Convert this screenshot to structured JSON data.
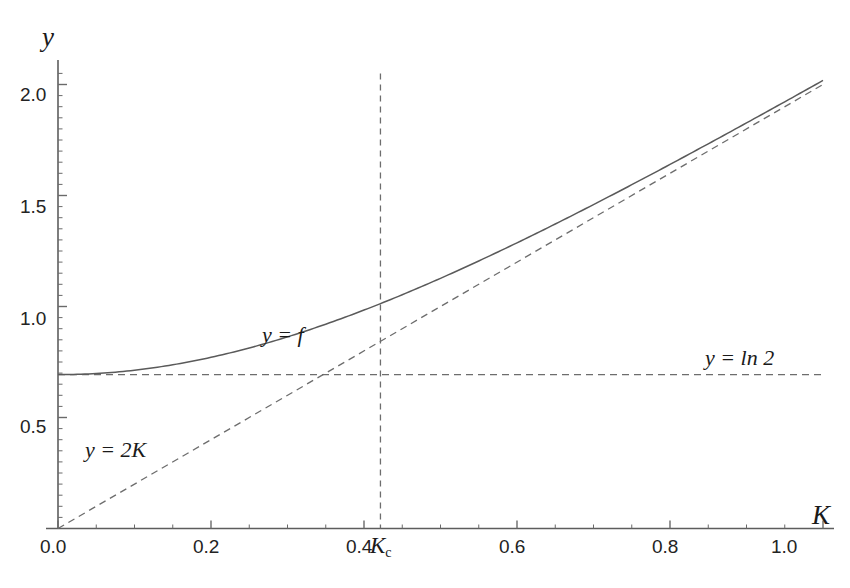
{
  "chart_data": {
    "type": "line",
    "title": "",
    "xlabel": "K",
    "ylabel": "y",
    "xlim": [
      0.0,
      1.0
    ],
    "ylim": [
      0.0,
      2.05
    ],
    "grid": false,
    "legend_position": "inline-annotations",
    "x_ticks": [
      "0.0",
      "0.2",
      "0.4",
      "0.6",
      "0.8",
      "1.0"
    ],
    "x_tick_values": [
      0.0,
      0.2,
      0.4,
      0.6,
      0.8,
      1.0
    ],
    "x_minor_tick_step": 0.05,
    "y_ticks": [
      "0.5",
      "1.0",
      "1.5",
      "2.0"
    ],
    "y_tick_values": [
      0.5,
      1.0,
      1.5,
      2.0
    ],
    "y_minor_tick_step": 0.05,
    "series": [
      {
        "name": "y = f",
        "style": "solid",
        "label": "y = f",
        "label_math": {
          "lhs": "y",
          "op": "=",
          "rhs": "f"
        },
        "x": [
          0.0,
          0.05,
          0.1,
          0.15,
          0.2,
          0.25,
          0.3,
          0.35,
          0.4,
          0.45,
          0.5,
          0.55,
          0.6,
          0.65,
          0.7,
          0.75,
          0.8,
          0.85,
          0.9,
          0.95,
          1.0
        ],
        "y": [
          0.693,
          0.696,
          0.705,
          0.721,
          0.744,
          0.773,
          0.809,
          0.851,
          0.898,
          0.95,
          1.006,
          1.065,
          1.127,
          1.192,
          1.259,
          1.327,
          1.397,
          1.468,
          1.54,
          1.613,
          1.687
        ]
      },
      {
        "name": "y = 2K",
        "style": "dashed",
        "label": "y = 2K",
        "label_math": {
          "lhs": "y",
          "op": "=",
          "rhs": "2K"
        },
        "x": [
          0.0,
          1.0
        ],
        "y": [
          0.0,
          2.0
        ]
      },
      {
        "name": "y = ln 2",
        "style": "dashed",
        "label": "y = ln 2",
        "label_math": {
          "lhs": "y",
          "op": "=",
          "rhs": "ln 2"
        },
        "x": [
          0.0,
          1.0
        ],
        "y": [
          0.693,
          0.693
        ]
      }
    ],
    "annotations": [
      {
        "name": "kc-marker",
        "label": "K",
        "sub": "c",
        "x": 0.4215,
        "type": "vertical-dashed-line",
        "y_top": 2.05,
        "y_bottom": 0.0
      }
    ]
  },
  "labels": {
    "y_axis": "y",
    "x_axis": "K",
    "curve_f": "y = f",
    "curve_2k": "y = 2K",
    "curve_ln2": "y = ln 2",
    "kc_main": "K",
    "kc_sub": "c"
  },
  "colors": {
    "axis": "#4a4a4a",
    "curve": "#5a5a5a",
    "dashed": "#6a6a6a",
    "text": "#1a1a1a",
    "background": "#ffffff"
  }
}
